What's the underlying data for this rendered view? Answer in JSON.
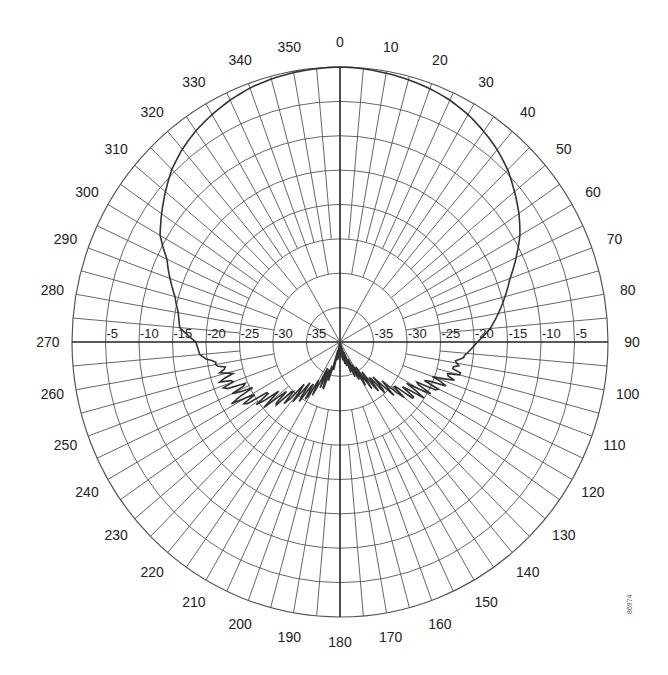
{
  "figure_id": "86974",
  "chart_data": {
    "type": "polar",
    "title": "",
    "center_px": [
      340,
      342
    ],
    "radius_px": [
      268,
      275
    ],
    "radial_axis": {
      "min_db": -40,
      "max_db": 0,
      "step_db": 5,
      "tick_labels_left": [
        "-5",
        "-10",
        "-15",
        "-20",
        "-25",
        "-30",
        "-35"
      ],
      "tick_labels_right": [
        "-35",
        "-30",
        "-25",
        "-20",
        "-15",
        "-10",
        "-5"
      ]
    },
    "angular_axis": {
      "direction": "clockwise",
      "zero_at": "top",
      "label_step_deg": 10,
      "labels": [
        "0",
        "10",
        "20",
        "30",
        "40",
        "50",
        "60",
        "70",
        "80",
        "90",
        "100",
        "110",
        "120",
        "130",
        "140",
        "150",
        "160",
        "170",
        "180",
        "190",
        "200",
        "210",
        "220",
        "230",
        "240",
        "250",
        "260",
        "270",
        "280",
        "290",
        "300",
        "310",
        "320",
        "330",
        "340",
        "350"
      ]
    },
    "grid": true,
    "series": [
      {
        "name": "radiation pattern",
        "angles_deg": [
          0,
          5,
          10,
          15,
          20,
          25,
          30,
          35,
          40,
          45,
          50,
          55,
          60,
          65,
          70,
          75,
          80,
          85,
          90,
          95,
          100,
          105,
          110,
          115,
          120,
          125,
          130,
          135,
          140,
          145,
          150,
          155,
          160,
          165,
          170,
          175,
          180,
          185,
          190,
          195,
          200,
          205,
          210,
          215,
          220,
          225,
          230,
          235,
          240,
          245,
          250,
          255,
          260,
          265,
          270,
          275,
          280,
          285,
          290,
          295,
          300,
          305,
          310,
          315,
          320,
          325,
          330,
          335,
          340,
          345,
          350,
          355
        ],
        "gain_db": [
          0,
          -0.1,
          -0.3,
          -0.5,
          -0.8,
          -1.2,
          -1.8,
          -2.6,
          -3.5,
          -4.6,
          -6,
          -7.4,
          -9,
          -11,
          -13,
          -14.5,
          -16,
          -17.5,
          -19.5,
          -21,
          -22.5,
          -22,
          -24,
          -25,
          -26.5,
          -27,
          -29,
          -31,
          -32,
          -33.5,
          -34.5,
          -36,
          -37,
          -38,
          -39,
          -39.5,
          -39,
          -39.5,
          -38.5,
          -37,
          -34,
          -34.5,
          -32,
          -31,
          -30.5,
          -28.5,
          -27,
          -26,
          -23,
          -24,
          -22,
          -22.5,
          -21.5,
          -19,
          -18.5,
          -16,
          -15.5,
          -14.5,
          -13,
          -11.5,
          -9,
          -7.5,
          -6,
          -4.5,
          -3.4,
          -2.5,
          -1.8,
          -1.2,
          -0.7,
          -0.4,
          -0.2,
          -0.1
        ]
      }
    ]
  }
}
